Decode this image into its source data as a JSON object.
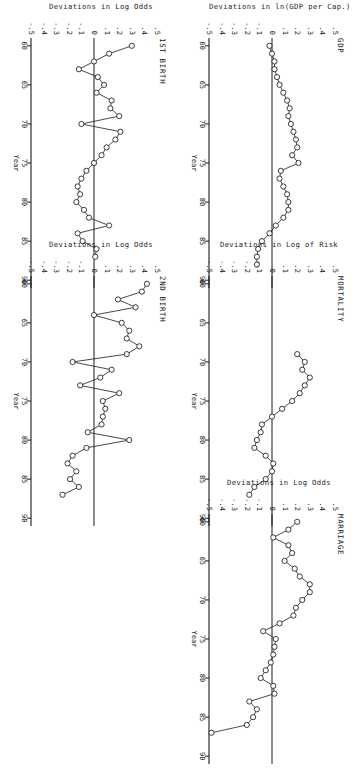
{
  "figure": {
    "orientation_note": "page-rotated-90",
    "ink_color": "#1a1a1a",
    "background": "#ffffff"
  },
  "axes": {
    "x_name": "Year",
    "x_ticks": [
      "60",
      "65",
      "70",
      "75",
      "80",
      "85",
      "90"
    ],
    "y_ticks": [
      ".5",
      ".4",
      ".3",
      ".2",
      ".1",
      "0",
      "-.1",
      "-.2",
      "-.3",
      "-.4",
      "-.5"
    ]
  },
  "panels": {
    "gdp": {
      "title": "GDP",
      "ylabel": "Deviations in ln(GDP per Cap.)"
    },
    "mortality": {
      "title": "MORTALITY",
      "ylabel": "Deviations in Log of Risk"
    },
    "marriage": {
      "title": "MARRIAGE",
      "ylabel": "Deviations in Log Odds"
    },
    "first_birth": {
      "title": "1ST BIRTH",
      "ylabel": "Deviations in Log Odds"
    },
    "second_birth": {
      "title": "2ND BIRTH",
      "ylabel": "Deviations in Log Odds"
    }
  },
  "chart_data": [
    {
      "id": "gdp",
      "type": "line",
      "title": "GDP",
      "xlabel": "Year",
      "ylabel": "Deviations in ln(GDP per Cap.)",
      "xlim": [
        59,
        91
      ],
      "ylim": [
        -0.5,
        0.5
      ],
      "x": [
        60,
        61,
        62,
        63,
        64,
        65,
        66,
        67,
        68,
        69,
        70,
        71,
        72,
        73,
        74,
        75,
        76,
        77,
        78,
        79,
        80,
        81,
        82,
        83,
        84,
        85,
        86,
        87,
        88
      ],
      "values": [
        -0.02,
        0.0,
        0.02,
        0.02,
        0.04,
        0.06,
        0.09,
        0.12,
        0.14,
        0.13,
        0.15,
        0.17,
        0.19,
        0.2,
        0.16,
        0.21,
        0.07,
        0.06,
        0.09,
        0.12,
        0.13,
        0.13,
        0.09,
        0.03,
        -0.02,
        -0.08,
        -0.11,
        -0.12,
        -0.12,
        -0.09
      ],
      "marker": "open-circle",
      "grid": false,
      "zero_line": true
    },
    {
      "id": "mortality",
      "type": "line",
      "title": "MORTALITY",
      "xlabel": "Year",
      "ylabel": "Deviations in Log of Risk",
      "xlim": [
        59,
        91
      ],
      "ylim": [
        -0.5,
        0.5
      ],
      "x": [
        69,
        70,
        71,
        72,
        73,
        74,
        75,
        76,
        77,
        78,
        79,
        80,
        81,
        82,
        83,
        84,
        85,
        86,
        87
      ],
      "values": [
        0.2,
        0.26,
        0.24,
        0.3,
        0.26,
        0.22,
        0.16,
        0.08,
        0.0,
        -0.08,
        -0.09,
        -0.12,
        -0.14,
        -0.05,
        0.01,
        0.0,
        -0.05,
        -0.14,
        -0.18,
        -0.21
      ],
      "marker": "open-circle",
      "grid": false,
      "zero_line": true
    },
    {
      "id": "marriage",
      "type": "line",
      "title": "MARRIAGE",
      "xlabel": "Year",
      "ylabel": "Deviations in Log Odds",
      "xlim": [
        59,
        91
      ],
      "ylim": [
        -0.5,
        0.5
      ],
      "x": [
        60,
        61,
        62,
        63,
        64,
        65,
        66,
        67,
        68,
        69,
        70,
        71,
        72,
        73,
        74,
        75,
        76,
        77,
        78,
        79,
        80,
        81,
        82,
        83,
        84,
        85,
        86,
        87
      ],
      "values": [
        0.2,
        0.13,
        0.01,
        0.13,
        0.16,
        0.1,
        0.18,
        0.22,
        0.3,
        0.3,
        0.24,
        0.19,
        0.17,
        0.06,
        -0.07,
        0.03,
        0.02,
        0.01,
        -0.01,
        -0.05,
        -0.09,
        0.01,
        0.02,
        -0.18,
        -0.12,
        -0.15,
        -0.2,
        -0.48
      ],
      "marker": "open-circle",
      "grid": false,
      "zero_line": true
    },
    {
      "id": "first_birth",
      "type": "line",
      "title": "1ST BIRTH",
      "xlabel": "Year",
      "ylabel": "Deviations in Log Odds",
      "xlim": [
        59,
        91
      ],
      "ylim": [
        -0.5,
        0.5
      ],
      "x": [
        60,
        61,
        62,
        63,
        64,
        65,
        66,
        67,
        68,
        69,
        70,
        71,
        72,
        73,
        74,
        75,
        76,
        77,
        78,
        79,
        80,
        81,
        82,
        83,
        84,
        85,
        86,
        87
      ],
      "values": [
        0.3,
        0.12,
        0.0,
        -0.12,
        0.03,
        0.08,
        0.02,
        0.14,
        0.13,
        0.2,
        -0.1,
        0.21,
        0.17,
        0.1,
        0.06,
        0.0,
        -0.06,
        -0.1,
        -0.13,
        -0.11,
        -0.14,
        -0.08,
        -0.04,
        0.12,
        -0.13,
        -0.09,
        0.02,
        0.01
      ],
      "marker": "open-circle",
      "grid": false,
      "zero_line": true
    },
    {
      "id": "second_birth",
      "type": "line",
      "title": "2ND BIRTH",
      "xlabel": "Year",
      "ylabel": "Deviations in Log Odds",
      "xlim": [
        59,
        91
      ],
      "ylim": [
        -0.5,
        0.5
      ],
      "x": [
        60,
        61,
        62,
        63,
        64,
        65,
        66,
        67,
        68,
        69,
        70,
        71,
        72,
        73,
        74,
        75,
        76,
        77,
        78,
        79,
        80,
        81,
        82,
        83,
        84,
        85,
        86,
        87
      ],
      "values": [
        0.42,
        0.38,
        0.19,
        0.33,
        0.0,
        0.22,
        0.28,
        0.26,
        0.36,
        0.26,
        -0.17,
        0.14,
        0.05,
        -0.11,
        0.2,
        0.07,
        0.09,
        0.07,
        0.06,
        -0.05,
        0.28,
        -0.06,
        -0.17,
        -0.21,
        -0.14,
        -0.19,
        -0.12,
        -0.25
      ],
      "marker": "open-circle",
      "grid": false,
      "zero_line": true
    }
  ]
}
